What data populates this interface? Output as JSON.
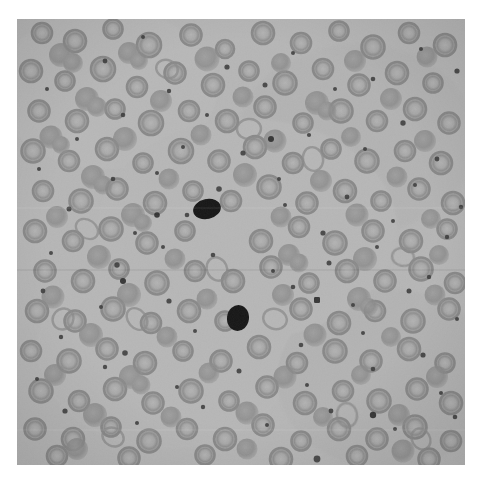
{
  "image": {
    "kind": "micrograph",
    "subject": "peripheral-blood-smear",
    "modality": "brightfield-light-microscopy",
    "rendering": "grayscale",
    "canvas": {
      "width": 488,
      "height": 479
    },
    "page_background_color": "#ffffff",
    "field": {
      "left": 17,
      "top": 19,
      "width": 448,
      "height": 446,
      "background_color": "#b6b6b6",
      "background_color_light": "#c2c2c2",
      "background_color_dark": "#ababab"
    },
    "palette": {
      "field_base": "#b6b6b6",
      "cell_mid": "#949494",
      "cell_dark": "#7e7e7e",
      "cell_rim": "#888888",
      "cell_pale_center": "#b0b0b0",
      "speck_dark": "#3a3a3a",
      "nucleated_cell": "#141414",
      "paper_white": "#ffffff",
      "vignette": "#9c9c9c"
    },
    "noise": {
      "grain_opacity": 0.22,
      "grain_scale": 2
    }
  },
  "features": {
    "erythrocyte_count": 268,
    "platelet_speck_count": 74,
    "dark_nucleated_cells": [
      {
        "label": "dark-cell-upper",
        "cx": 207,
        "cy": 209,
        "rx": 14,
        "ry": 10,
        "rotation": -12,
        "color": "#141414"
      },
      {
        "label": "dark-cell-lower",
        "cx": 238,
        "cy": 318,
        "rx": 11,
        "ry": 13,
        "rotation": 8,
        "color": "#181818"
      }
    ],
    "erythrocyte_diameter_px": {
      "min": 13,
      "max": 30,
      "typical": 21
    },
    "speck_diameter_px": {
      "min": 2,
      "max": 6
    },
    "morphology_notes": "ring-shaped cells with central pallor; frequent overlapping doublets and rouleaux-like clusters"
  },
  "annotations": {
    "title": "",
    "caption": "",
    "scale_bar": "",
    "labels": []
  }
}
